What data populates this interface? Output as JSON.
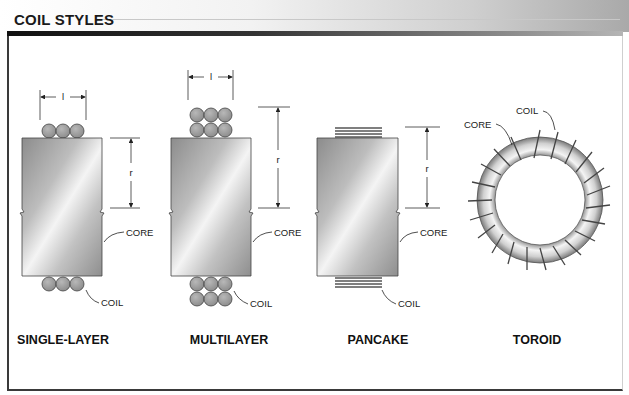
{
  "title": "COIL STYLES",
  "panels": [
    {
      "caption": "SINGLE-LAYER",
      "labels": {
        "core": "CORE",
        "coil": "COIL",
        "length_dim": "l",
        "radius_dim": "r"
      }
    },
    {
      "caption": "MULTILAYER",
      "labels": {
        "core": "CORE",
        "coil": "COIL",
        "length_dim": "l",
        "radius_dim": "r"
      }
    },
    {
      "caption": "PANCAKE",
      "labels": {
        "core": "CORE",
        "coil": "COIL",
        "radius_dim": "r"
      }
    },
    {
      "caption": "TOROID",
      "labels": {
        "core": "CORE",
        "coil": "COIL"
      }
    }
  ],
  "colors": {
    "core_dark": "#8e8e8e",
    "core_light": "#f0f0f0",
    "coil": "#9a9a9a",
    "line": "#2a2a2a"
  }
}
